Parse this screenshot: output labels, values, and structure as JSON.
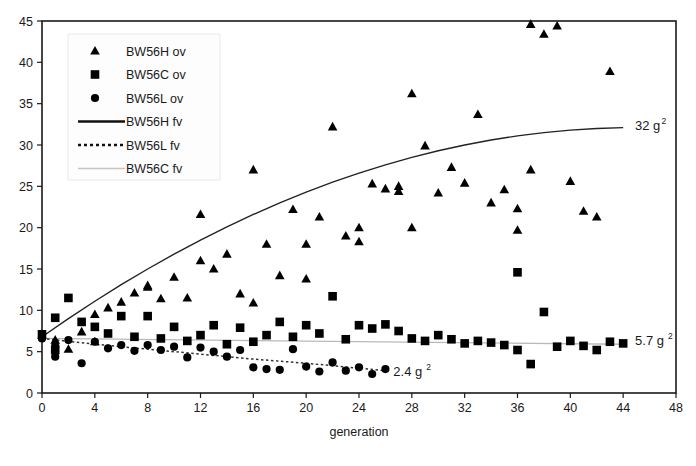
{
  "chart_data": {
    "type": "scatter",
    "title": "",
    "xlabel": "generation",
    "ylabel": "",
    "xlim": [
      0,
      48
    ],
    "ylim": [
      0,
      45
    ],
    "xticks": [
      0,
      4,
      8,
      12,
      16,
      20,
      24,
      28,
      32,
      36,
      40,
      44,
      48
    ],
    "yticks": [
      0,
      5,
      10,
      15,
      20,
      25,
      30,
      35,
      40,
      45
    ],
    "grid": false,
    "legend_position": "top-left",
    "colors": {
      "marker": "#000000",
      "fit_high": "#222222",
      "fit_low": "#333333",
      "fit_control": "#b9b9b9",
      "frame": "#1a1a1a"
    },
    "legend": [
      {
        "label": "BW56H ov",
        "marker": "triangle",
        "style": "marker"
      },
      {
        "label": "BW56C ov",
        "marker": "square",
        "style": "marker"
      },
      {
        "label": "BW56L ov",
        "marker": "circle",
        "style": "marker"
      },
      {
        "label": "BW56H fv",
        "marker": "line-solid",
        "style": "line"
      },
      {
        "label": "BW56L fv",
        "marker": "line-dotted",
        "style": "line"
      },
      {
        "label": "BW56C fv",
        "marker": "line-gray",
        "style": "line"
      }
    ],
    "annotations": [
      {
        "text": "32 g",
        "sup": "2",
        "x": 44.9,
        "y": 32.4
      },
      {
        "text": "5.7 g",
        "sup": "2",
        "x": 44.9,
        "y": 6.3
      },
      {
        "text": "2.4 g",
        "sup": "2",
        "x": 26.6,
        "y": 2.6
      }
    ],
    "series": [
      {
        "name": "BW56H ov",
        "marker": "triangle",
        "points": [
          [
            0,
            7.0
          ],
          [
            1,
            6.4
          ],
          [
            2,
            5.3
          ],
          [
            3,
            7.4
          ],
          [
            4,
            6.2
          ],
          [
            4,
            9.5
          ],
          [
            5,
            10.3
          ],
          [
            6,
            11.0
          ],
          [
            7,
            12.1
          ],
          [
            8,
            12.8
          ],
          [
            8,
            13.0
          ],
          [
            9,
            11.4
          ],
          [
            10,
            14.0
          ],
          [
            11,
            11.5
          ],
          [
            12,
            21.6
          ],
          [
            12,
            16.0
          ],
          [
            13,
            15.0
          ],
          [
            14,
            16.8
          ],
          [
            15,
            12.0
          ],
          [
            16,
            27.0
          ],
          [
            16,
            10.9
          ],
          [
            17,
            18.0
          ],
          [
            18,
            14.2
          ],
          [
            19,
            22.2
          ],
          [
            20,
            18.0
          ],
          [
            20,
            13.8
          ],
          [
            21,
            21.3
          ],
          [
            22,
            32.2
          ],
          [
            23,
            19.0
          ],
          [
            24,
            20.0
          ],
          [
            24,
            18.3
          ],
          [
            25,
            25.3
          ],
          [
            26,
            24.7
          ],
          [
            27,
            25.0
          ],
          [
            27,
            24.4
          ],
          [
            28,
            36.2
          ],
          [
            28,
            20.0
          ],
          [
            29,
            29.9
          ],
          [
            30,
            24.2
          ],
          [
            31,
            27.3
          ],
          [
            32,
            25.4
          ],
          [
            33,
            33.7
          ],
          [
            34,
            23.0
          ],
          [
            35,
            24.6
          ],
          [
            36,
            22.3
          ],
          [
            36,
            19.7
          ],
          [
            37,
            44.6
          ],
          [
            37,
            27.0
          ],
          [
            38,
            43.4
          ],
          [
            39,
            44.4
          ],
          [
            40,
            25.6
          ],
          [
            41,
            22.0
          ],
          [
            42,
            21.3
          ],
          [
            43,
            38.9
          ]
        ]
      },
      {
        "name": "BW56C ov",
        "marker": "square",
        "points": [
          [
            0,
            7.1
          ],
          [
            1,
            5.2
          ],
          [
            1,
            9.1
          ],
          [
            2,
            11.5
          ],
          [
            3,
            8.6
          ],
          [
            4,
            8.0
          ],
          [
            5,
            7.2
          ],
          [
            6,
            9.3
          ],
          [
            7,
            6.8
          ],
          [
            8,
            9.3
          ],
          [
            9,
            6.6
          ],
          [
            10,
            8.0
          ],
          [
            11,
            6.3
          ],
          [
            12,
            7.0
          ],
          [
            13,
            8.2
          ],
          [
            14,
            5.9
          ],
          [
            15,
            7.9
          ],
          [
            16,
            6.2
          ],
          [
            17,
            7.0
          ],
          [
            18,
            8.6
          ],
          [
            19,
            6.8
          ],
          [
            20,
            8.2
          ],
          [
            21,
            7.2
          ],
          [
            22,
            11.7
          ],
          [
            23,
            6.5
          ],
          [
            24,
            8.2
          ],
          [
            25,
            7.8
          ],
          [
            26,
            8.3
          ],
          [
            27,
            7.5
          ],
          [
            28,
            6.6
          ],
          [
            29,
            6.3
          ],
          [
            30,
            7.0
          ],
          [
            31,
            6.5
          ],
          [
            32,
            6.0
          ],
          [
            33,
            6.3
          ],
          [
            34,
            6.1
          ],
          [
            35,
            5.8
          ],
          [
            36,
            14.6
          ],
          [
            36,
            5.2
          ],
          [
            37,
            3.5
          ],
          [
            38,
            9.8
          ],
          [
            39,
            5.6
          ],
          [
            40,
            6.3
          ],
          [
            41,
            5.7
          ],
          [
            42,
            5.2
          ],
          [
            43,
            6.2
          ],
          [
            44,
            6.0
          ]
        ]
      },
      {
        "name": "BW56L ov",
        "marker": "circle",
        "points": [
          [
            0,
            6.6
          ],
          [
            1,
            5.7
          ],
          [
            1,
            4.4
          ],
          [
            2,
            6.4
          ],
          [
            3,
            3.6
          ],
          [
            4,
            6.2
          ],
          [
            5,
            5.4
          ],
          [
            6,
            5.8
          ],
          [
            7,
            5.1
          ],
          [
            8,
            5.8
          ],
          [
            9,
            5.2
          ],
          [
            10,
            5.6
          ],
          [
            11,
            4.3
          ],
          [
            12,
            5.5
          ],
          [
            13,
            5.0
          ],
          [
            14,
            4.4
          ],
          [
            15,
            5.2
          ],
          [
            16,
            3.1
          ],
          [
            17,
            2.9
          ],
          [
            18,
            2.8
          ],
          [
            19,
            5.3
          ],
          [
            20,
            3.2
          ],
          [
            21,
            2.6
          ],
          [
            22,
            3.7
          ],
          [
            23,
            2.7
          ],
          [
            24,
            3.1
          ],
          [
            25,
            2.3
          ],
          [
            26,
            2.9
          ]
        ]
      }
    ],
    "fits": [
      {
        "name": "BW56H fv",
        "style": "solid",
        "color": "#222222",
        "points": [
          [
            0,
            6.8
          ],
          [
            2,
            9.0
          ],
          [
            4,
            11.1
          ],
          [
            6,
            13.1
          ],
          [
            8,
            15.0
          ],
          [
            10,
            16.8
          ],
          [
            12,
            18.5
          ],
          [
            14,
            20.1
          ],
          [
            16,
            21.6
          ],
          [
            18,
            23.0
          ],
          [
            20,
            24.3
          ],
          [
            22,
            25.5
          ],
          [
            24,
            26.6
          ],
          [
            26,
            27.6
          ],
          [
            28,
            28.5
          ],
          [
            30,
            29.3
          ],
          [
            32,
            30.0
          ],
          [
            34,
            30.6
          ],
          [
            36,
            31.1
          ],
          [
            38,
            31.5
          ],
          [
            40,
            31.8
          ],
          [
            42,
            32.0
          ],
          [
            44,
            32.1
          ]
        ],
        "end_value": 32
      },
      {
        "name": "BW56C fv",
        "style": "solid-gray",
        "color": "#b9b9b9",
        "points": [
          [
            0,
            6.6
          ],
          [
            44,
            5.9
          ]
        ],
        "end_value": 5.7
      },
      {
        "name": "BW56L fv",
        "style": "dotted",
        "color": "#333333",
        "points": [
          [
            0,
            6.6
          ],
          [
            4,
            5.9
          ],
          [
            8,
            5.3
          ],
          [
            12,
            4.7
          ],
          [
            16,
            4.1
          ],
          [
            20,
            3.6
          ],
          [
            24,
            3.0
          ],
          [
            26,
            2.7
          ]
        ],
        "end_value": 2.4
      }
    ]
  }
}
